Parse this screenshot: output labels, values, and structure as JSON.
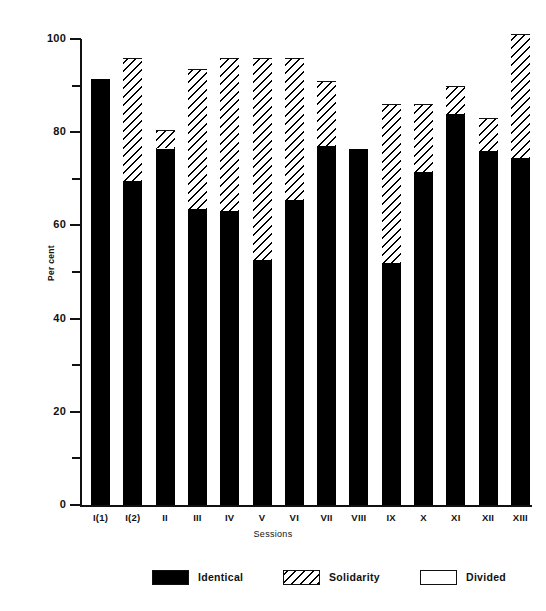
{
  "chart_data": {
    "type": "bar",
    "subtype": "stacked-100-percent",
    "title": "",
    "xlabel": "Sessions",
    "ylabel": "Per cent",
    "ylim": [
      0,
      100
    ],
    "y_major_ticks": [
      0,
      20,
      40,
      60,
      80,
      100
    ],
    "y_major_tick_labels": [
      "0",
      "20",
      "40",
      "60",
      "80",
      "100"
    ],
    "y_minor_ticks": [
      10,
      30,
      50,
      70,
      90
    ],
    "grid": false,
    "legend_position": "bottom",
    "categories": [
      "I(1)",
      "I(2)",
      "II",
      "III",
      "IV",
      "V",
      "VI",
      "VII",
      "VIII",
      "IX",
      "X",
      "XI",
      "XII",
      "XIII"
    ],
    "series": [
      {
        "name": "Identical",
        "color": "#000000",
        "pattern": "solid",
        "values": [
          91.5,
          69.5,
          76.5,
          63.5,
          63.0,
          52.5,
          65.5,
          77.0,
          76.5,
          52.0,
          71.5,
          84.0,
          76.0,
          74.5
        ]
      },
      {
        "name": "Solidarity",
        "color": "#ffffff",
        "pattern": "diagonal-hatch",
        "values": [
          0.0,
          26.5,
          4.0,
          30.0,
          33.0,
          43.5,
          30.5,
          14.0,
          0.0,
          34.0,
          14.5,
          6.0,
          7.0,
          26.5
        ]
      },
      {
        "name": "Divided",
        "color": "#ffffff",
        "pattern": "empty",
        "values": [
          8.5,
          4.0,
          19.5,
          6.5,
          4.0,
          4.0,
          4.0,
          9.0,
          23.5,
          14.0,
          14.0,
          10.0,
          17.0,
          0.0
        ]
      }
    ],
    "cumulative_tops": {
      "identical": [
        91.5,
        69.5,
        76.5,
        63.5,
        63.0,
        52.5,
        65.5,
        77.0,
        76.5,
        52.0,
        71.5,
        84.0,
        76.0,
        74.5
      ],
      "solidarity": [
        91.5,
        96.0,
        80.5,
        93.5,
        96.0,
        96.0,
        96.0,
        91.0,
        76.5,
        86.0,
        86.0,
        90.0,
        83.0,
        101.0
      ],
      "divided": [
        100,
        100,
        100,
        100,
        100,
        100,
        100,
        100,
        100,
        100,
        100,
        100,
        100,
        101
      ]
    }
  },
  "axes": {
    "y_title": "Per cent",
    "x_title": "Sessions",
    "y_labels": [
      "100",
      "80",
      "60",
      "40",
      "20",
      "0"
    ],
    "x_labels": [
      "I(1)",
      "I(2)",
      "II",
      "III",
      "IV",
      "V",
      "VI",
      "VII",
      "VIII",
      "IX",
      "X",
      "XI",
      "XII",
      "XIII"
    ]
  },
  "legend": {
    "items": [
      {
        "label": "Identical",
        "swatch": "solid-black-swatch"
      },
      {
        "label": "Solidarity",
        "swatch": "hatched-swatch"
      },
      {
        "label": "Divided",
        "swatch": "empty-swatch"
      }
    ]
  }
}
